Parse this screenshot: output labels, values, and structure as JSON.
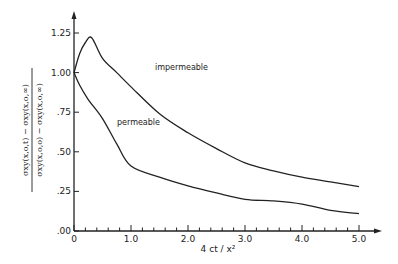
{
  "chart_data": {
    "type": "line",
    "title": "",
    "xlabel": "4 ct / x²",
    "ylabel_numerator": "σxy(x,o,t) − σxy(x,o,∞)",
    "ylabel_denominator": "σxy(x,o,o) − σxy(x,o,∞)",
    "xlim": [
      0,
      5.0
    ],
    "ylim": [
      0,
      1.25
    ],
    "xticks": [
      "0",
      "1.0",
      "2.0",
      "3.0",
      "4.0",
      "5.0"
    ],
    "yticks": [
      ".00",
      ".25",
      ".50",
      ".75",
      "1.00",
      "1.25"
    ],
    "grid": false,
    "legend": "inline labels",
    "series": [
      {
        "name": "impermeable",
        "x": [
          0,
          0.1,
          0.2,
          0.31,
          0.5,
          0.75,
          1.0,
          1.5,
          2.0,
          2.5,
          3.0,
          3.5,
          4.0,
          4.5,
          5.0
        ],
        "values": [
          1.0,
          1.12,
          1.19,
          1.22,
          1.09,
          1.0,
          0.91,
          0.74,
          0.62,
          0.52,
          0.43,
          0.38,
          0.34,
          0.31,
          0.28
        ]
      },
      {
        "name": "permeable",
        "x": [
          0,
          0.1,
          0.25,
          0.5,
          0.75,
          1.0,
          1.5,
          2.0,
          2.5,
          3.0,
          3.5,
          4.0,
          4.5,
          5.0
        ],
        "values": [
          1.0,
          0.92,
          0.83,
          0.71,
          0.55,
          0.41,
          0.34,
          0.285,
          0.24,
          0.2,
          0.19,
          0.17,
          0.13,
          0.11
        ]
      }
    ]
  }
}
